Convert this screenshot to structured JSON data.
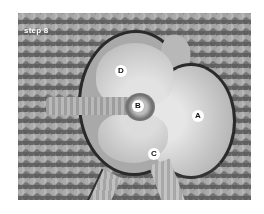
{
  "figure": {
    "caption": "step 8",
    "labels": [
      {
        "id": "A",
        "text": "A"
      },
      {
        "id": "B",
        "text": "B"
      },
      {
        "id": "C",
        "text": "C"
      },
      {
        "id": "D",
        "text": "D"
      }
    ]
  }
}
